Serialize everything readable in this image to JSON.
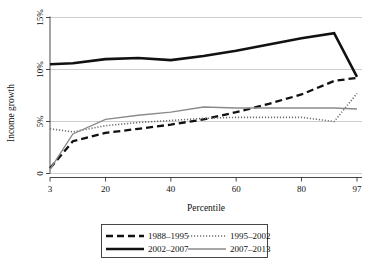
{
  "chart_data": {
    "type": "line",
    "title": "",
    "xlabel": "Percentile",
    "ylabel": "Income growth",
    "xlim": [
      3,
      97
    ],
    "ylim": [
      0,
      15
    ],
    "xticks": [
      3,
      20,
      40,
      60,
      80,
      97
    ],
    "xticklabels": [
      "3",
      "20",
      "40",
      "60",
      "80",
      "97"
    ],
    "yticks": [
      0,
      5,
      10,
      15
    ],
    "yticklabels": [
      "0",
      "5%",
      "10%",
      "15%"
    ],
    "grid": true,
    "grid_axis": "y",
    "legend_position": "below-center",
    "series": [
      {
        "name": "1988–1995",
        "style": "dashed",
        "color": "#111111",
        "width": 2.3,
        "dash": "7,4",
        "x": [
          3,
          10,
          20,
          30,
          40,
          50,
          60,
          70,
          80,
          90,
          97
        ],
        "values": [
          0.5,
          3.1,
          3.9,
          4.3,
          4.7,
          5.2,
          5.9,
          6.7,
          7.6,
          8.9,
          9.2
        ]
      },
      {
        "name": "1995–2002",
        "style": "dotted",
        "color": "#6f6f6f",
        "width": 1.6,
        "dash": "1.2,1.8",
        "x": [
          3,
          10,
          20,
          30,
          40,
          50,
          60,
          70,
          80,
          90,
          97
        ],
        "values": [
          4.3,
          4.0,
          4.6,
          4.9,
          5.1,
          5.3,
          5.4,
          5.4,
          5.4,
          5.0,
          7.7
        ]
      },
      {
        "name": "2002–2007",
        "style": "solid",
        "color": "#111111",
        "width": 2.6,
        "dash": "",
        "x": [
          3,
          10,
          20,
          30,
          40,
          50,
          60,
          70,
          80,
          90,
          97
        ],
        "values": [
          10.5,
          10.6,
          11.0,
          11.1,
          10.9,
          11.3,
          11.8,
          12.4,
          13.0,
          13.5,
          9.3
        ]
      },
      {
        "name": "2007–2013",
        "style": "solid",
        "color": "#8a8a8a",
        "width": 1.4,
        "dash": "",
        "x": [
          3,
          10,
          20,
          30,
          40,
          50,
          60,
          70,
          80,
          90,
          97
        ],
        "values": [
          0.4,
          3.8,
          5.2,
          5.6,
          5.9,
          6.4,
          6.3,
          6.3,
          6.3,
          6.3,
          6.2
        ]
      }
    ]
  },
  "legend": {
    "entries": [
      {
        "label": "1988–1995"
      },
      {
        "label": "1995–2002"
      },
      {
        "label": "2002–2007"
      },
      {
        "label": "2007–2013"
      }
    ]
  },
  "axes": {
    "ylabel": "Income growth",
    "xlabel": "Percentile",
    "yticklabels": [
      "0",
      "5%",
      "10%",
      "15%"
    ],
    "xticklabels": [
      "3",
      "20",
      "40",
      "60",
      "80",
      "97"
    ]
  }
}
